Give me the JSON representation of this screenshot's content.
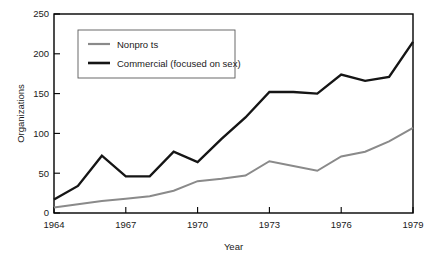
{
  "chart_data": {
    "type": "line",
    "title": "",
    "xlabel": "Year",
    "ylabel": "Organizations",
    "xlim": [
      1964,
      1979
    ],
    "ylim": [
      0,
      250
    ],
    "grid": false,
    "legend_position": "upper-left",
    "xticks": [
      "1964",
      "1967",
      "1970",
      "1973",
      "1976",
      "1979"
    ],
    "xtick_values": [
      1964,
      1967,
      1970,
      1973,
      1976,
      1979
    ],
    "yticks": [
      "0",
      "50",
      "100",
      "150",
      "200",
      "250"
    ],
    "ytick_values": [
      0,
      50,
      100,
      150,
      200,
      250
    ],
    "x": [
      1964,
      1965,
      1966,
      1967,
      1968,
      1969,
      1970,
      1971,
      1972,
      1973,
      1974,
      1975,
      1976,
      1977,
      1978,
      1979
    ],
    "series": [
      {
        "name": "Nonpro ts",
        "color": "#8a8a8a",
        "line_width": 2.0,
        "values": [
          7,
          11,
          15,
          18,
          21,
          28,
          40,
          43,
          47,
          65,
          59,
          53,
          71,
          77,
          90,
          107
        ]
      },
      {
        "name": "Commercial (focused on sex)",
        "color": "#151515",
        "line_width": 2.4,
        "values": [
          17,
          34,
          72,
          46,
          46,
          77,
          64,
          93,
          120,
          152,
          152,
          150,
          174,
          166,
          171,
          215
        ]
      }
    ]
  },
  "legend": {
    "entries": [
      {
        "label": "Nonpro ts",
        "swatch_color": "#8a8a8a"
      },
      {
        "label": "Commercial (focused on sex)",
        "swatch_color": "#151515"
      }
    ]
  },
  "axes": {
    "y_title": "Organizations",
    "x_title": "Year",
    "y_tick_0": "0",
    "y_tick_1": "50",
    "y_tick_2": "100",
    "y_tick_3": "150",
    "y_tick_4": "200",
    "y_tick_5": "250",
    "x_tick_0": "1964",
    "x_tick_1": "1967",
    "x_tick_2": "1970",
    "x_tick_3": "1973",
    "x_tick_4": "1976",
    "x_tick_5": "1979"
  }
}
